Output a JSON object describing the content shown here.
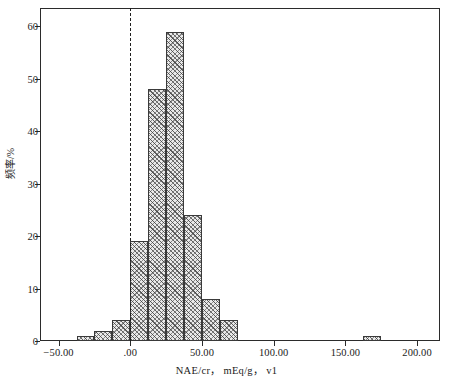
{
  "chart_data": {
    "type": "bar",
    "title": "",
    "subtitle": "",
    "xlabel": "NAE/cr， mEq/g， v1",
    "ylabel": "频率/%",
    "xlim": [
      -63.0,
      216.0
    ],
    "ylim": [
      0,
      63.5
    ],
    "grid": false,
    "legend": null,
    "bin_width": 12.5,
    "x_ticks": [
      -50,
      0,
      50,
      100,
      150,
      200
    ],
    "x_tick_labels": [
      "−50.00",
      ".00",
      "50.00",
      "100.00",
      "150.00",
      "200.00"
    ],
    "y_ticks": [
      0,
      10,
      20,
      30,
      40,
      50,
      60
    ],
    "y_tick_labels": [
      "0",
      "10",
      "20",
      "30",
      "40",
      "50",
      "60"
    ],
    "bins": [
      {
        "left": -37.5,
        "right": -25.0,
        "value": 1
      },
      {
        "left": -25.0,
        "right": -12.5,
        "value": 2
      },
      {
        "left": -12.5,
        "right": 0.0,
        "value": 4
      },
      {
        "left": 0.0,
        "right": 12.5,
        "value": 19
      },
      {
        "left": 12.5,
        "right": 25.0,
        "value": 48
      },
      {
        "left": 25.0,
        "right": 37.5,
        "value": 59
      },
      {
        "left": 37.5,
        "right": 50.0,
        "value": 24
      },
      {
        "left": 50.0,
        "right": 62.5,
        "value": 8
      },
      {
        "left": 62.5,
        "right": 75.0,
        "value": 4
      },
      {
        "left": 162.5,
        "right": 175.0,
        "value": 1
      }
    ],
    "categories": [
      "-37.5",
      "-25.0",
      "-12.5",
      "0.0",
      "12.5",
      "25.0",
      "37.5",
      "50.0",
      "62.5",
      "162.5"
    ],
    "values": [
      1,
      2,
      4,
      19,
      48,
      59,
      24,
      8,
      4,
      1
    ],
    "annotations": [
      {
        "type": "vline",
        "name": "zero-reference-line",
        "x": 0.0,
        "style": "dashed",
        "color": "#1f1f1f"
      }
    ],
    "colors": {
      "bar_fill": "#e9e9e9",
      "bar_edge": "#3a3a3a",
      "axis": "#2b2b2b",
      "text": "#1a1a1a",
      "reference_line": "#1f1f1f"
    }
  }
}
